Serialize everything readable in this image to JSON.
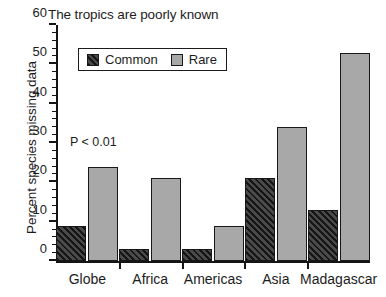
{
  "chart_data": {
    "type": "bar",
    "title": "The tropics are poorly known",
    "xlabel": "",
    "ylabel": "Percent species missing data",
    "categories": [
      "Globe",
      "Africa",
      "Americas",
      "Asia",
      "Madagascar"
    ],
    "series": [
      {
        "name": "Common",
        "values": [
          9,
          3,
          3,
          21,
          13
        ],
        "color": "#2b2b2b",
        "pattern": "diagonal-hatch"
      },
      {
        "name": "Rare",
        "values": [
          24,
          21,
          9,
          34,
          53
        ],
        "color": "#a8a8a8",
        "pattern": "solid"
      }
    ],
    "ylim": [
      0,
      60
    ],
    "ytick_major": [
      0,
      10,
      20,
      30,
      40,
      50,
      60
    ],
    "ytick_minor_step": 2,
    "ytick_labels": [
      "0",
      "10",
      "20",
      "30",
      "40",
      "50",
      "60"
    ],
    "grid": false,
    "legend_position": "upper-left-inside",
    "annotations": [
      {
        "text": "P < 0.01",
        "x_category": "Globe",
        "y_value": 27
      }
    ]
  },
  "legend": {
    "entries": [
      {
        "label": "Common"
      },
      {
        "label": "Rare"
      }
    ]
  },
  "annotation": {
    "p_value_text": "P < 0.01"
  }
}
